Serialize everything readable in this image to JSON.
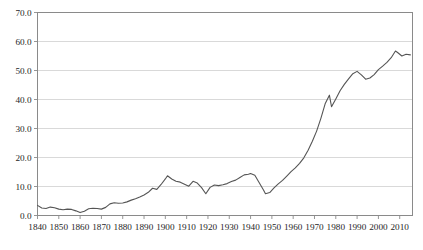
{
  "chart_data": {
    "type": "line",
    "title": "",
    "subtitle": "",
    "xlabel": "",
    "ylabel": "",
    "xlim": [
      1840,
      2016
    ],
    "ylim": [
      0.0,
      70.0
    ],
    "grid": true,
    "grid_axis": "y",
    "legend": false,
    "legend_position": "none",
    "line_color": "#555555",
    "grid_color": "#cfcfcf",
    "axis_color": "#8a8a8a",
    "background_color": "#ffffff",
    "y_ticks": [
      0.0,
      10.0,
      20.0,
      30.0,
      40.0,
      50.0,
      60.0,
      70.0
    ],
    "y_tick_labels": [
      "0.0",
      "10.0",
      "20.0",
      "30.0",
      "40.0",
      "50.0",
      "60.0",
      "70.0"
    ],
    "x_ticks": [
      1840,
      1850,
      1860,
      1870,
      1880,
      1890,
      1900,
      1910,
      1920,
      1930,
      1940,
      1950,
      1960,
      1970,
      1980,
      1990,
      2000,
      2010
    ],
    "x_tick_labels": [
      "1840",
      "1850",
      "1860",
      "1870",
      "1880",
      "1890",
      "1900",
      "1910",
      "1920",
      "1930",
      "1940",
      "1950",
      "1960",
      "1970",
      "1980",
      "1990",
      "2000",
      "2010"
    ],
    "series": [
      {
        "name": "series-1",
        "color": "#555555",
        "x": [
          1840,
          1842,
          1844,
          1846,
          1848,
          1850,
          1852,
          1854,
          1856,
          1858,
          1860,
          1862,
          1864,
          1866,
          1868,
          1870,
          1872,
          1874,
          1876,
          1878,
          1880,
          1882,
          1884,
          1886,
          1888,
          1890,
          1892,
          1894,
          1896,
          1898,
          1900,
          1901,
          1903,
          1905,
          1907,
          1909,
          1911,
          1913,
          1915,
          1917,
          1919,
          1921,
          1923,
          1925,
          1927,
          1929,
          1931,
          1933,
          1935,
          1937,
          1939,
          1940,
          1942,
          1944,
          1946,
          1947,
          1949,
          1951,
          1953,
          1955,
          1957,
          1959,
          1961,
          1963,
          1965,
          1967,
          1969,
          1971,
          1973,
          1975,
          1977,
          1978,
          1980,
          1982,
          1984,
          1986,
          1988,
          1990,
          1992,
          1994,
          1996,
          1998,
          2000,
          2002,
          2004,
          2006,
          2008,
          2009,
          2011,
          2013,
          2015
        ],
        "y": [
          3.5,
          2.6,
          2.4,
          2.9,
          2.7,
          2.2,
          2.0,
          2.2,
          2.1,
          1.6,
          1.0,
          1.5,
          2.3,
          2.5,
          2.4,
          2.2,
          2.8,
          4.0,
          4.4,
          4.2,
          4.3,
          4.7,
          5.3,
          5.8,
          6.4,
          7.1,
          8.0,
          9.4,
          9.0,
          10.7,
          12.6,
          13.7,
          12.6,
          11.8,
          11.5,
          10.8,
          10.1,
          11.8,
          11.2,
          9.6,
          7.5,
          9.7,
          10.5,
          10.3,
          10.6,
          11.0,
          11.7,
          12.2,
          13.1,
          14.0,
          14.2,
          14.5,
          13.9,
          11.4,
          8.9,
          7.5,
          7.9,
          9.5,
          10.9,
          12.1,
          13.6,
          15.1,
          16.4,
          18.0,
          19.9,
          22.5,
          25.6,
          29.1,
          33.5,
          38.5,
          41.5,
          37.5,
          40.2,
          43.0,
          45.2,
          47.1,
          48.9,
          49.7,
          48.5,
          47.0,
          47.4,
          48.6,
          50.3,
          51.5,
          52.8,
          54.4,
          56.7,
          56.2,
          55.0,
          55.6,
          55.4
        ]
      }
    ]
  }
}
